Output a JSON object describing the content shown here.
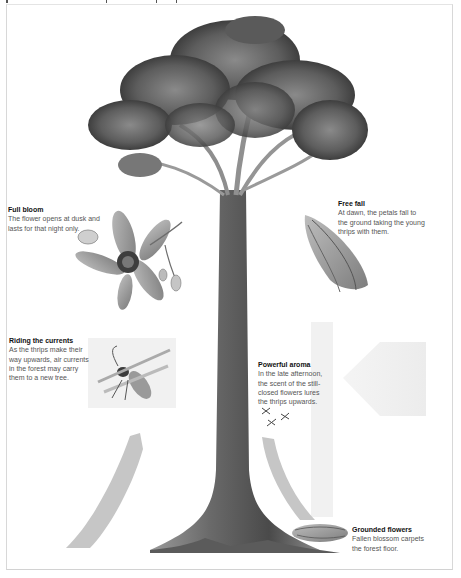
{
  "diagram": {
    "colors": {
      "arrow_fill": "#c9c9c9",
      "arrow_light": "#ececec",
      "foliage_dark": "#4a4a4a",
      "foliage_mid": "#7a7a7a",
      "trunk": "#6b6b6b",
      "text_title": "#111111",
      "text_body": "#555555"
    },
    "captions": [
      {
        "id": "full-bloom",
        "title": "Full bloom",
        "lines": [
          "The flower opens at dusk and",
          "lasts for that night only."
        ]
      },
      {
        "id": "free-fall",
        "title": "Free fall",
        "lines": [
          "At dawn, the petals fall to",
          "the ground taking the young",
          "thrips with them."
        ]
      },
      {
        "id": "riding-the-currents",
        "title": "Riding the currents",
        "lines": [
          "As the thrips make their",
          "way upwards, air currents",
          "in the forest may carry",
          "them to a new tree."
        ]
      },
      {
        "id": "powerful-aroma",
        "title": "Powerful aroma",
        "lines": [
          "In the late afternoon,",
          "the scent of the still-",
          "closed flowers lures",
          "the thrips upwards."
        ]
      },
      {
        "id": "grounded-flowers",
        "title": "Grounded flowers",
        "lines": [
          "Fallen blossom carpets",
          "the forest floor."
        ]
      }
    ],
    "illustrations": [
      {
        "name": "tree",
        "label": "Tall rainforest tree"
      },
      {
        "name": "open-flower",
        "label": "Open flower in full bloom"
      },
      {
        "name": "closed-flower-bud",
        "label": "Fallen closed flower"
      },
      {
        "name": "thrips-insect",
        "label": "Thrips insect"
      },
      {
        "name": "flying-thrips",
        "label": "Small thrips flying upward"
      },
      {
        "name": "fallen-blossom",
        "label": "Fallen blossom on the ground"
      }
    ],
    "arrows": [
      {
        "name": "arrow-down-right",
        "direction": "down"
      },
      {
        "name": "arrow-left",
        "direction": "left"
      },
      {
        "name": "arrow-up-left",
        "direction": "up"
      },
      {
        "name": "arrow-up-right",
        "direction": "up"
      }
    ]
  }
}
